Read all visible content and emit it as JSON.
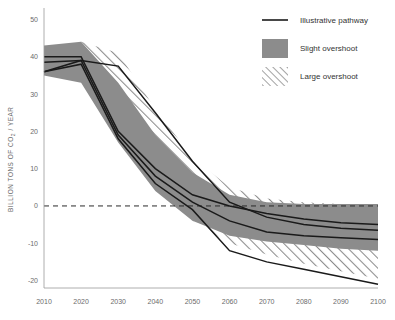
{
  "chart_data": {
    "type": "line",
    "title": "",
    "xlabel": "",
    "ylabel": "BILLION TONS OF CO2 / YEAR",
    "ylabel_display": "BILLION TONS OF CO₂ / YEAR",
    "xlim": [
      2010,
      2100
    ],
    "ylim": [
      -22,
      52
    ],
    "x_ticks": [
      2010,
      2020,
      2030,
      2040,
      2050,
      2060,
      2070,
      2080,
      2090,
      2100
    ],
    "y_ticks": [
      50,
      40,
      30,
      20,
      10,
      0,
      -10,
      -20
    ],
    "grid": false,
    "zero_reference_line": 0,
    "legend_position": "top-right",
    "legend": [
      {
        "key": "illustrative_pathway",
        "label": "Illustrative pathway",
        "marker": "line",
        "color": "#1a1a1a"
      },
      {
        "key": "slight_overshoot",
        "label": "Slight overshoot",
        "marker": "swatch",
        "color": "#8c8c8c"
      },
      {
        "key": "large_overshoot",
        "label": "Large overshoot",
        "marker": "hatch",
        "color": "#8c8c8c"
      }
    ],
    "x": [
      2010,
      2020,
      2030,
      2040,
      2050,
      2060,
      2070,
      2080,
      2090,
      2100
    ],
    "bands": [
      {
        "name": "Slight overshoot",
        "style": "solid-fill",
        "color": "#8c8c8c",
        "upper": [
          43,
          44,
          33,
          19,
          9,
          3,
          1,
          0.5,
          0.5,
          0.5
        ],
        "lower": [
          35,
          33,
          17,
          4,
          -4,
          -8,
          -9.5,
          -10.5,
          -11.5,
          -12
        ]
      },
      {
        "name": "Large overshoot",
        "style": "hatched",
        "color": "#8c8c8c",
        "upper": [
          41,
          44,
          41,
          26,
          13,
          5,
          2,
          1,
          0.5,
          0
        ],
        "lower": [
          36,
          34,
          20,
          6,
          -4,
          -10,
          -13,
          -15.5,
          -17.5,
          -19.5
        ]
      }
    ],
    "series": [
      {
        "name": "Illustrative pathway 1",
        "values": [
          40,
          40,
          20,
          10,
          3,
          0,
          -2,
          -3.5,
          -4.5,
          -5
        ]
      },
      {
        "name": "Illustrative pathway 2",
        "values": [
          38.5,
          39,
          37.5,
          25,
          12,
          1,
          -3,
          -5,
          -6,
          -6.5
        ]
      },
      {
        "name": "Illustrative pathway 3",
        "values": [
          36,
          39,
          19,
          8,
          1,
          -4,
          -7,
          -8,
          -8.5,
          -9
        ]
      },
      {
        "name": "Illustrative pathway 4",
        "values": [
          36,
          38,
          18,
          6,
          -1,
          -12,
          -15,
          -17,
          -19,
          -21
        ]
      }
    ]
  }
}
